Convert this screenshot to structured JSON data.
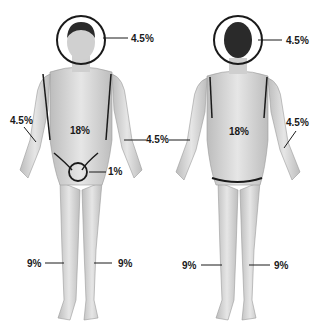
{
  "figures": [
    {
      "view": "front",
      "labels": {
        "head": "4.5%",
        "left_arm": "4.5%",
        "right_arm": "4.5%",
        "torso": "18%",
        "genitals": "1%",
        "left_leg": "9%",
        "right_leg": "9%"
      }
    },
    {
      "view": "back",
      "labels": {
        "head": "4.5%",
        "right_arm": "4.5%",
        "torso": "18%",
        "left_leg": "9%",
        "right_leg": "9%"
      }
    }
  ],
  "colors": {
    "skin": "#d9d9d9",
    "skin_shade": "#b5b5b5",
    "outline": "#1a1a1a",
    "hair": "#2a2a2a"
  }
}
